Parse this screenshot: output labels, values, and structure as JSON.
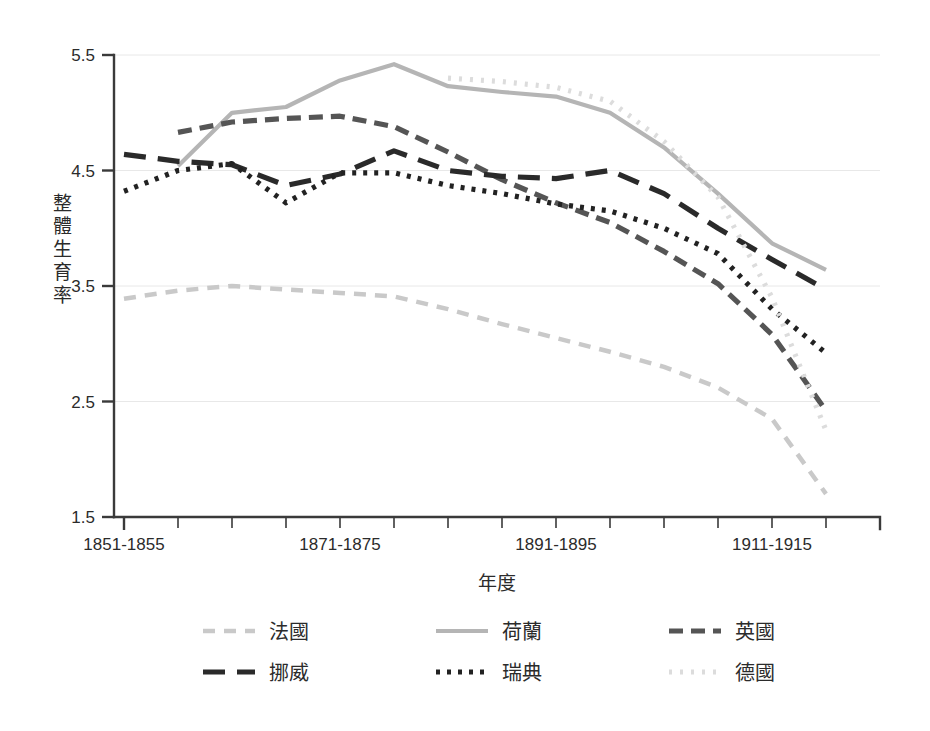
{
  "chart_data": {
    "type": "line",
    "title": "",
    "xlabel": "年度",
    "ylabel": "整體生育率",
    "ylim": [
      1.5,
      5.5
    ],
    "yticks": [
      1.5,
      2.5,
      3.5,
      4.5,
      5.5
    ],
    "ytick_labels": [
      "1.5",
      "2.5",
      "3.5",
      "4.5",
      "5.5"
    ],
    "grid": true,
    "legend_position": "bottom",
    "x": [
      "1851-1855",
      "1856-1860",
      "1861-1865",
      "1866-1870",
      "1871-1875",
      "1876-1880",
      "1881-1885",
      "1886-1890",
      "1891-1895",
      "1896-1900",
      "1901-1905",
      "1906-1910",
      "1911-1915",
      "1916-1920"
    ],
    "xtick_labels_shown": [
      "1851-1855",
      "1871-1875",
      "1891-1895",
      "1911-1915"
    ],
    "xtick_label_indices": [
      0,
      4,
      8,
      12
    ],
    "series": [
      {
        "name": "法國",
        "key": "france",
        "color": "#c9c9c9",
        "dash": "12,9",
        "width": 4.5,
        "start_index": 0,
        "values": [
          3.39,
          3.46,
          3.5,
          3.47,
          3.44,
          3.41,
          3.3,
          3.17,
          3.05,
          2.93,
          2.8,
          2.62,
          2.35,
          1.7
        ]
      },
      {
        "name": "荷蘭",
        "key": "netherlands",
        "color": "#b5b5b5",
        "dash": "",
        "width": 4.2,
        "start_index": 1,
        "values": [
          null,
          4.54,
          5.0,
          5.05,
          5.28,
          5.42,
          5.23,
          5.18,
          5.14,
          5.0,
          4.7,
          4.3,
          3.87,
          3.64
        ]
      },
      {
        "name": "英國",
        "key": "england",
        "color": "#555555",
        "dash": "14,8",
        "width": 5.2,
        "start_index": 1,
        "values": [
          null,
          4.83,
          4.92,
          4.95,
          4.97,
          4.88,
          4.66,
          4.42,
          4.22,
          4.05,
          3.8,
          3.52,
          3.08,
          2.42
        ]
      },
      {
        "name": "挪威",
        "key": "norway",
        "color": "#2a2a2a",
        "dash": "22,12",
        "width": 5.2,
        "start_index": 0,
        "values": [
          4.64,
          4.58,
          4.55,
          4.37,
          4.47,
          4.67,
          4.5,
          4.45,
          4.43,
          4.5,
          4.3,
          4.0,
          3.73,
          3.47
        ]
      },
      {
        "name": "瑞典",
        "key": "sweden",
        "color": "#222222",
        "dash": "4,7",
        "width": 5.2,
        "start_index": 0,
        "values": [
          4.32,
          4.5,
          4.56,
          4.22,
          4.48,
          4.48,
          4.37,
          4.3,
          4.21,
          4.15,
          4.0,
          3.78,
          3.3,
          2.92
        ]
      },
      {
        "name": "德國",
        "key": "germany",
        "color": "#dcdcdc",
        "dash": "3,8",
        "width": 5.2,
        "start_index": 6,
        "values": [
          null,
          null,
          null,
          null,
          null,
          null,
          5.3,
          5.27,
          5.22,
          5.1,
          4.75,
          4.27,
          3.4,
          2.25
        ]
      }
    ],
    "legend_rows": [
      [
        "法國",
        "荷蘭",
        "英國"
      ],
      [
        "挪威",
        "瑞典",
        "德國"
      ]
    ]
  }
}
